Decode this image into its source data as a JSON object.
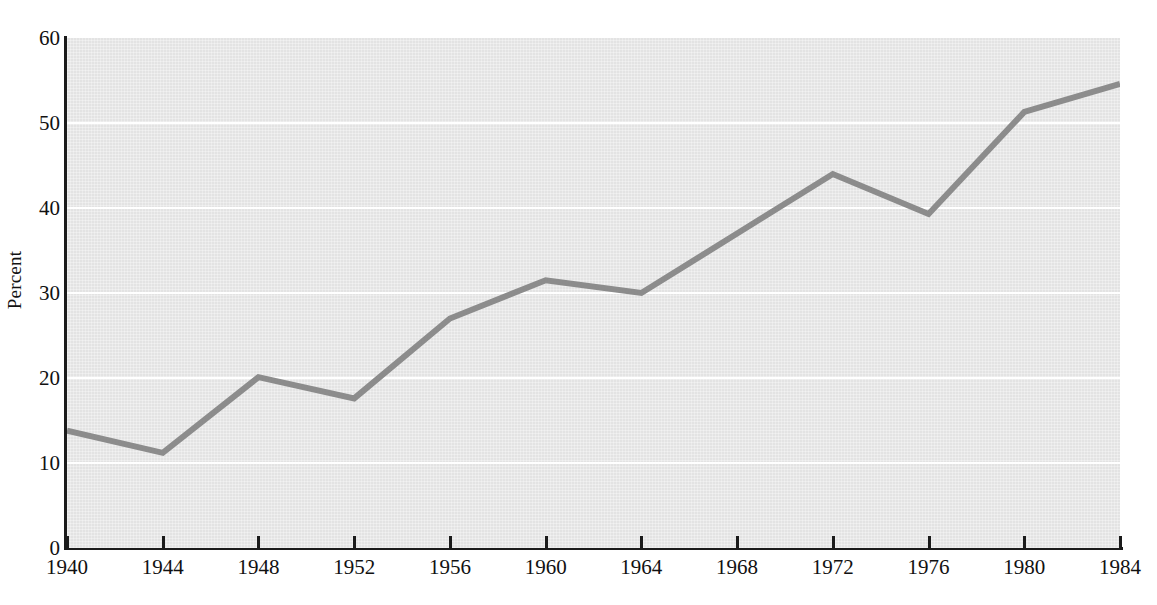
{
  "chart_data": {
    "type": "line",
    "title": "",
    "subtitle": "",
    "xlabel": "",
    "ylabel": "Percent",
    "x": [
      1940,
      1944,
      1948,
      1952,
      1956,
      1960,
      1964,
      1968,
      1972,
      1976,
      1980,
      1984
    ],
    "categories": [
      "1940",
      "1944",
      "1948",
      "1952",
      "1956",
      "1960",
      "1964",
      "1968",
      "1972",
      "1976",
      "1980",
      "1984"
    ],
    "values": [
      13.8,
      11.2,
      20.1,
      17.6,
      27.0,
      31.5,
      30.0,
      37.0,
      44.0,
      39.3,
      51.3,
      54.6
    ],
    "series": [
      {
        "name": "Percent",
        "values": [
          13.8,
          11.2,
          20.1,
          17.6,
          27.0,
          31.5,
          30.0,
          37.0,
          44.0,
          39.3,
          51.3,
          54.6
        ],
        "color": "#8c8c8c"
      }
    ],
    "xlim": [
      1940,
      1984
    ],
    "ylim": [
      0,
      60
    ],
    "xticks": [
      1940,
      1944,
      1948,
      1952,
      1956,
      1960,
      1964,
      1968,
      1972,
      1976,
      1980,
      1984
    ],
    "xtick_labels": [
      "1940",
      "1944",
      "1948",
      "1952",
      "1956",
      "1960",
      "1964",
      "1968",
      "1972",
      "1976",
      "1980",
      "1984"
    ],
    "yticks": [
      0,
      10,
      20,
      30,
      40,
      50,
      60
    ],
    "ytick_labels": [
      "0",
      "10",
      "20",
      "30",
      "40",
      "50",
      "60"
    ],
    "gridlines": {
      "horizontal": [
        10,
        20,
        30,
        40,
        50
      ],
      "vertical": [],
      "color": "#ffffff"
    },
    "legend": {
      "visible": false,
      "position": "none",
      "entries": []
    },
    "annotations": [],
    "plot_background": "#e3e3e3",
    "figure_background": "#ffffff",
    "axis_color": "#1b1b1b",
    "line_width_px": 6
  }
}
